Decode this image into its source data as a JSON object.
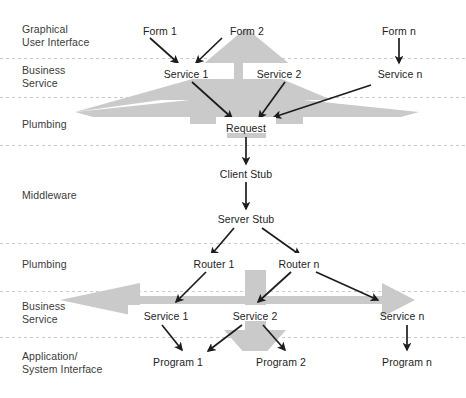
{
  "diagram": {
    "background_color": "#ffffff",
    "shape_color": "#cacaca",
    "divider_color": "#c9c9c9",
    "text_color": "#1d1d1d",
    "band_label_color": "#3a3a3a",
    "bands": [
      {
        "id": "gui",
        "lines": [
          "Graphical",
          "User Interface"
        ]
      },
      {
        "id": "business-top",
        "lines": [
          "Business",
          "Service"
        ]
      },
      {
        "id": "plumbing-top",
        "lines": [
          "Plumbing"
        ]
      },
      {
        "id": "middleware",
        "lines": [
          "Middleware"
        ]
      },
      {
        "id": "plumbing-bottom",
        "lines": [
          "Plumbing"
        ]
      },
      {
        "id": "business-bottom",
        "lines": [
          "Business",
          "Service"
        ]
      },
      {
        "id": "application",
        "lines": [
          "Application/",
          "System Interface"
        ]
      }
    ],
    "nodes": [
      {
        "id": "form-1",
        "label": "Form 1",
        "x": 160,
        "y": 31,
        "band": "gui"
      },
      {
        "id": "form-2",
        "label": "Form 2",
        "x": 247,
        "y": 31,
        "band": "gui"
      },
      {
        "id": "form-n",
        "label": "Form n",
        "x": 399,
        "y": 31,
        "band": "gui"
      },
      {
        "id": "service-1-top",
        "label": "Service 1",
        "x": 186,
        "y": 75,
        "band": "business-top"
      },
      {
        "id": "service-2-top",
        "label": "Service 2",
        "x": 279,
        "y": 75,
        "band": "business-top"
      },
      {
        "id": "service-n-top",
        "label": "Service n",
        "x": 400,
        "y": 75,
        "band": "business-top"
      },
      {
        "id": "request",
        "label": "Request",
        "x": 246,
        "y": 129,
        "band": "plumbing-top"
      },
      {
        "id": "client-stub",
        "label": "Client Stub",
        "x": 246,
        "y": 175,
        "band": "middleware"
      },
      {
        "id": "server-stub",
        "label": "Server Stub",
        "x": 246,
        "y": 220,
        "band": "middleware"
      },
      {
        "id": "router-1",
        "label": "Router 1",
        "x": 214,
        "y": 265,
        "band": "plumbing-bottom"
      },
      {
        "id": "router-n",
        "label": "Router n",
        "x": 299,
        "y": 265,
        "band": "plumbing-bottom"
      },
      {
        "id": "service-1-bottom",
        "label": "Service 1",
        "x": 166,
        "y": 317,
        "band": "business-bottom"
      },
      {
        "id": "service-2-bottom",
        "label": "Service 2",
        "x": 255,
        "y": 317,
        "band": "business-bottom"
      },
      {
        "id": "service-n-bottom",
        "label": "Service n",
        "x": 402,
        "y": 317,
        "band": "business-bottom"
      },
      {
        "id": "program-1",
        "label": "Program 1",
        "x": 178,
        "y": 363,
        "band": "application"
      },
      {
        "id": "program-2",
        "label": "Program 2",
        "x": 281,
        "y": 363,
        "band": "application"
      },
      {
        "id": "program-n",
        "label": "Program n",
        "x": 407,
        "y": 363,
        "band": "application"
      }
    ],
    "connections": [
      {
        "id": "form1-to-service1",
        "from": "form-1",
        "to": "service-1-top"
      },
      {
        "id": "form2-to-service1",
        "from": "form-2",
        "to": "service-1-top"
      },
      {
        "id": "formn-to-servicen",
        "from": "form-n",
        "to": "service-n-top"
      },
      {
        "id": "service1-to-request",
        "from": "service-1-top",
        "to": "request"
      },
      {
        "id": "service2-to-request",
        "from": "service-2-top",
        "to": "request"
      },
      {
        "id": "servicen-to-request",
        "from": "service-n-top",
        "to": "request"
      },
      {
        "id": "request-to-client-stub",
        "from": "request",
        "to": "client-stub"
      },
      {
        "id": "client-stub-to-server-stub",
        "from": "client-stub",
        "to": "server-stub"
      },
      {
        "id": "server-stub-to-router1",
        "from": "server-stub",
        "to": "router-1"
      },
      {
        "id": "server-stub-to-routern",
        "from": "server-stub",
        "to": "router-n"
      },
      {
        "id": "router1-to-service1",
        "from": "router-1",
        "to": "service-1-bottom"
      },
      {
        "id": "routern-to-service2",
        "from": "router-n",
        "to": "service-2-bottom"
      },
      {
        "id": "routern-to-servicen",
        "from": "router-n",
        "to": "service-n-bottom"
      },
      {
        "id": "service1-to-program1",
        "from": "service-1-bottom",
        "to": "program-1"
      },
      {
        "id": "service2-to-program1",
        "from": "service-2-bottom",
        "to": "program-1"
      },
      {
        "id": "service2-to-program2",
        "from": "service-2-bottom",
        "to": "program-2"
      },
      {
        "id": "servicen-to-programn",
        "from": "service-n-bottom",
        "to": "program-n"
      }
    ]
  }
}
